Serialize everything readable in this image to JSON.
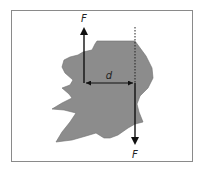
{
  "diagram": {
    "type": "force-couple-torque",
    "frame_color": "#8a8a8a",
    "body_fill": "#8c8c8c",
    "body_stroke": "#6e6e6e",
    "arrow_color": "#111111",
    "labels": {
      "force_top": "F",
      "force_bottom": "F",
      "distance": "d"
    },
    "forces": [
      {
        "name": "upward-force",
        "label": "F",
        "direction": "up"
      },
      {
        "name": "downward-force",
        "label": "F",
        "direction": "down"
      }
    ],
    "distance_label": "d",
    "line_of_action": "dotted"
  }
}
